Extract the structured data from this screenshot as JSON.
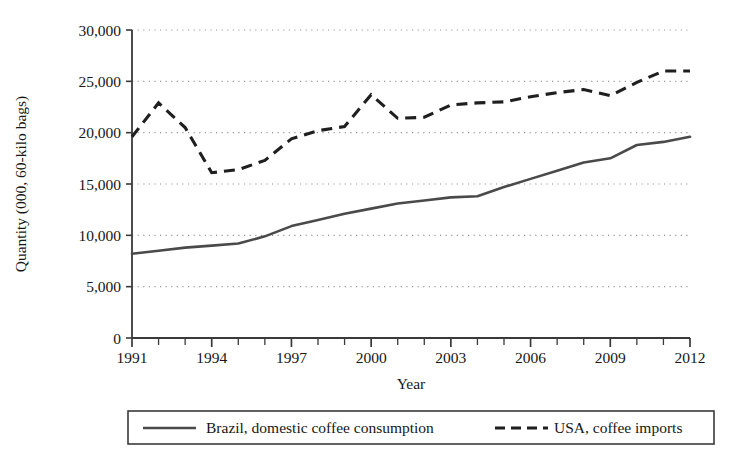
{
  "chart_data": {
    "type": "line",
    "title": "",
    "xlabel": "Year",
    "ylabel": "Quantity (000, 60-kilo bags)",
    "xlim": [
      1991,
      2012
    ],
    "ylim": [
      0,
      30000
    ],
    "grid": "horizontal-dotted",
    "legend_position": "bottom",
    "x": [
      1991,
      1992,
      1993,
      1994,
      1995,
      1996,
      1997,
      1998,
      1999,
      2000,
      2001,
      2002,
      2003,
      2004,
      2005,
      2006,
      2007,
      2008,
      2009,
      2010,
      2011,
      2012
    ],
    "xtick_labels": [
      "1991",
      "1994",
      "1997",
      "2000",
      "2003",
      "2006",
      "2009",
      "2012"
    ],
    "xtick_values": [
      1991,
      1994,
      1997,
      2000,
      2003,
      2006,
      2009,
      2012
    ],
    "ytick_labels": [
      "0",
      "5,000",
      "10,000",
      "15,000",
      "20,000",
      "25,000",
      "30,000"
    ],
    "ytick_values": [
      0,
      5000,
      10000,
      15000,
      20000,
      25000,
      30000
    ],
    "series": [
      {
        "name": "Brazil, domestic coffee consumption",
        "style": "solid",
        "color": "#4a4a4a",
        "values": [
          8200,
          8500,
          8800,
          9000,
          9200,
          9900,
          10900,
          11500,
          12100,
          12600,
          13100,
          13400,
          13700,
          13800,
          14700,
          15500,
          16300,
          17100,
          17500,
          18800,
          19100,
          19600
        ]
      },
      {
        "name": "USA, coffee imports",
        "style": "dashed",
        "color": "#1f1f1f",
        "values": [
          19600,
          22900,
          20500,
          16100,
          16400,
          17300,
          19400,
          20200,
          20600,
          23700,
          21400,
          21500,
          22700,
          22900,
          23000,
          23500,
          23900,
          24200,
          23600,
          24900,
          26000,
          26000
        ]
      }
    ]
  },
  "legend": {
    "items": [
      {
        "label": "Brazil, domestic coffee consumption",
        "style": "solid"
      },
      {
        "label": "USA, coffee imports",
        "style": "dashed"
      }
    ]
  },
  "colors": {
    "brazil_line": "#4a4a4a",
    "usa_line": "#1f1f1f",
    "axis": "#3a3a3a",
    "gridline": "#9a9a9a",
    "background": "#ffffff"
  }
}
